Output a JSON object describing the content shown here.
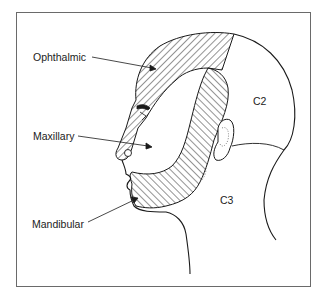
{
  "figure": {
    "type": "dermatome-map",
    "colors": {
      "frame": "#6a6a6a",
      "line": "#1a1a1a",
      "hatch": "#2a2a2a",
      "background": "#ffffff"
    }
  },
  "labels": {
    "ophthalmic": "Ophthalmic",
    "maxillary": "Maxillary",
    "mandibular": "Mandibular",
    "c2": "C2",
    "c3": "C3"
  },
  "regions": [
    {
      "id": "ophthalmic",
      "label": "Ophthalmic",
      "style": "hatched",
      "area": "forehead, scalp front, nose bridge"
    },
    {
      "id": "maxillary",
      "label": "Maxillary",
      "style": "unshaded",
      "area": "cheek, upper lip"
    },
    {
      "id": "mandibular",
      "label": "Mandibular",
      "style": "hatched",
      "area": "jaw, chin, temple strip"
    },
    {
      "id": "c2",
      "label": "C2",
      "style": "unshaded",
      "area": "back of scalp"
    },
    {
      "id": "c3",
      "label": "C3",
      "style": "unshaded",
      "area": "neck"
    }
  ]
}
